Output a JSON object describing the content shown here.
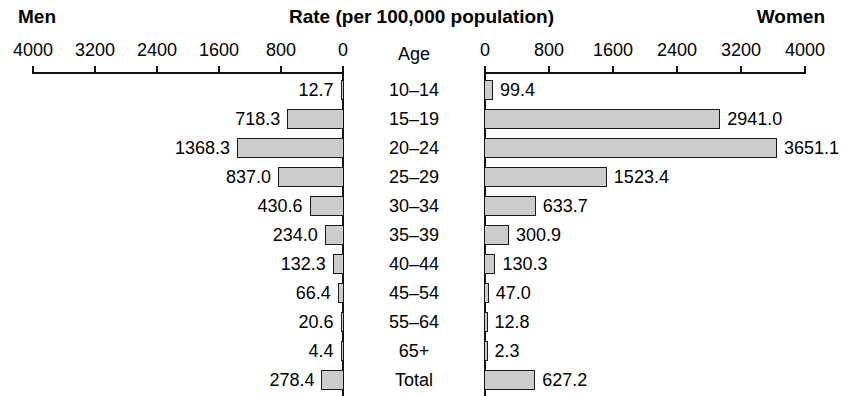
{
  "header": {
    "left_label": "Men",
    "center_label": "Rate (per 100,000 population)",
    "right_label": "Women"
  },
  "axis": {
    "age_column_header": "Age",
    "left_ticks": [
      "4000",
      "3200",
      "2400",
      "1600",
      "800",
      "0"
    ],
    "right_ticks": [
      "0",
      "800",
      "1600",
      "2400",
      "3200",
      "4000"
    ]
  },
  "colors": {
    "bar_fill": "#cccccc",
    "bar_stroke": "#1a1a1a",
    "text": "#000000",
    "background": "#ffffff"
  },
  "chart_data": {
    "type": "bar",
    "title": "Rate (per 100,000 population)",
    "subtype": "population-pyramid",
    "xlabel": "Rate (per 100,000 population)",
    "ylabel": "Age",
    "xlim": [
      0,
      4000
    ],
    "grid": false,
    "legend": "none",
    "left_series_name": "Men",
    "right_series_name": "Women",
    "categories": [
      "10–14",
      "15–19",
      "20–24",
      "25–29",
      "30–34",
      "35–39",
      "40–44",
      "45–54",
      "55–64",
      "65+",
      "Total"
    ],
    "series": [
      {
        "name": "Men",
        "side": "left",
        "values": [
          12.7,
          718.3,
          1368.3,
          837.0,
          430.6,
          234.0,
          132.3,
          66.4,
          20.6,
          4.4,
          278.4
        ],
        "labels": [
          "12.7",
          "718.3",
          "1368.3",
          "837.0",
          "430.6",
          "234.0",
          "132.3",
          "66.4",
          "20.6",
          "4.4",
          "278.4"
        ]
      },
      {
        "name": "Women",
        "side": "right",
        "values": [
          99.4,
          2941.0,
          3651.1,
          1523.4,
          633.7,
          300.9,
          130.3,
          47.0,
          12.8,
          2.3,
          627.2
        ],
        "labels": [
          "99.4",
          "2941.0",
          "3651.1",
          "1523.4",
          "633.7",
          "300.9",
          "130.3",
          "47.0",
          "12.8",
          "2.3",
          "627.2"
        ]
      }
    ],
    "tick_values": [
      0,
      800,
      1600,
      2400,
      3200,
      4000
    ]
  }
}
